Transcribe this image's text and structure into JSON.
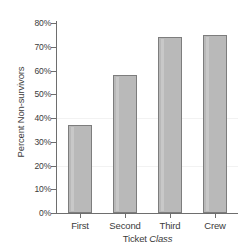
{
  "chart_data": {
    "type": "bar",
    "title": "",
    "subtitle": "",
    "xlabel": "Ticket Class",
    "xlabel_plain": "Ticket",
    "xlabel_italic": "Class",
    "ylabel": "Percent Non-survivors",
    "categories": [
      "First",
      "Second",
      "Third",
      "Crew"
    ],
    "values": [
      37,
      58,
      74,
      75
    ],
    "value_labels": [
      "37%",
      "58%",
      "74%",
      "75%"
    ],
    "ytick_labels": [
      "0%",
      "10%",
      "20%",
      "30%",
      "40%",
      "50%",
      "60%",
      "70%",
      "80%"
    ],
    "ytick_values": [
      0,
      10,
      20,
      30,
      40,
      50,
      60,
      70,
      80
    ],
    "ylim": [
      0,
      80
    ],
    "grid": false,
    "legend": "none",
    "legend_position": "none",
    "bar_fill_color": "#b9b9b9",
    "bar_edge_color": "#7d7d7d",
    "axis_color": "#6e6e6e",
    "text_color": "#3b3b3b",
    "background_color": "#ffffff",
    "inner_gridline_color": "#f2f2f2",
    "inner_gridline_values": [
      20,
      40
    ]
  }
}
